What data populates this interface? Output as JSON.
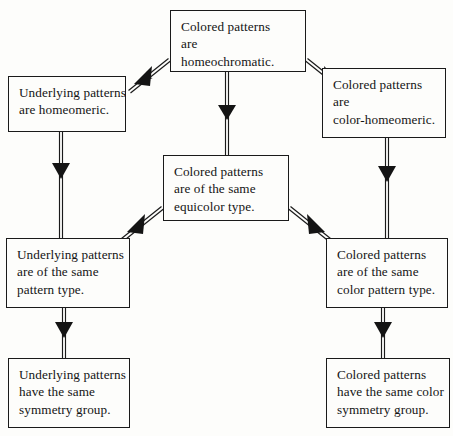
{
  "diagram": {
    "nodes": [
      {
        "id": "top",
        "name": "node-colored-patterns-homeochromatic",
        "lines": [
          "Colored patterns",
          "are",
          "homeochromatic."
        ]
      },
      {
        "id": "left-top",
        "name": "node-underlying-patterns-homeomeric",
        "lines": [
          "Underlying patterns",
          "are homeomeric."
        ]
      },
      {
        "id": "right-top",
        "name": "node-colored-patterns-color-homeomeric",
        "lines": [
          "Colored patterns",
          "are",
          "color-homeomeric."
        ]
      },
      {
        "id": "center",
        "name": "node-colored-patterns-equicolor-type",
        "lines": [
          "Colored patterns",
          "are of the same",
          "equicolor type."
        ]
      },
      {
        "id": "left-mid",
        "name": "node-underlying-patterns-pattern-type",
        "lines": [
          "Underlying patterns",
          "are of the same",
          "pattern type."
        ]
      },
      {
        "id": "right-mid",
        "name": "node-colored-patterns-color-pattern-type",
        "lines": [
          "Colored patterns",
          "are of the same",
          "color pattern type."
        ]
      },
      {
        "id": "left-bottom",
        "name": "node-underlying-patterns-symmetry-group",
        "lines": [
          "Underlying patterns",
          "have the same",
          "symmetry group."
        ]
      },
      {
        "id": "right-bottom",
        "name": "node-colored-patterns-color-symmetry-group",
        "lines": [
          "Colored patterns",
          "have the same color",
          "symmetry group."
        ]
      }
    ],
    "edges": [
      {
        "name": "edge-top-to-left-top",
        "from": "top",
        "to": "left-top",
        "style": "double-line-arrow"
      },
      {
        "name": "edge-top-to-right-top",
        "from": "top",
        "to": "right-top",
        "style": "double-line-arrow"
      },
      {
        "name": "edge-top-to-center",
        "from": "top",
        "to": "center",
        "style": "double-line-arrow"
      },
      {
        "name": "edge-left-top-to-left-mid",
        "from": "left-top",
        "to": "left-mid",
        "style": "double-line-arrow"
      },
      {
        "name": "edge-right-top-to-right-mid",
        "from": "right-top",
        "to": "right-mid",
        "style": "double-line-arrow"
      },
      {
        "name": "edge-center-to-left-mid",
        "from": "center",
        "to": "left-mid",
        "style": "double-line-arrow"
      },
      {
        "name": "edge-center-to-right-mid",
        "from": "center",
        "to": "right-mid",
        "style": "double-line-arrow"
      },
      {
        "name": "edge-left-mid-to-left-bottom",
        "from": "left-mid",
        "to": "left-bottom",
        "style": "double-line-arrow"
      },
      {
        "name": "edge-right-mid-to-right-bottom",
        "from": "right-mid",
        "to": "right-bottom",
        "style": "double-line-arrow"
      }
    ],
    "colors": {
      "background": "#fdfdfb",
      "box_border": "#1a1a1a",
      "text": "#141414",
      "edge": "#1a1a1a"
    }
  }
}
